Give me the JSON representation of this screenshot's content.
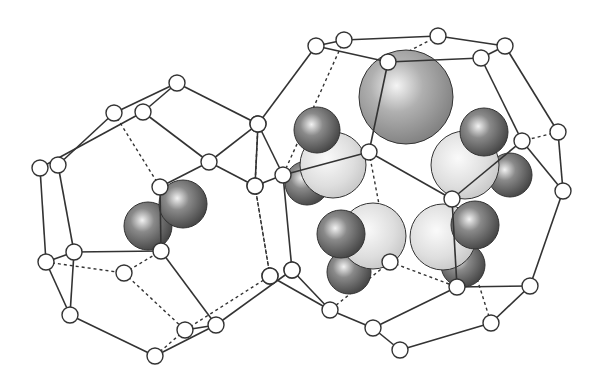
{
  "figure": {
    "left_cage": {
      "label": "small cage with diatomic guest",
      "nodes": [
        [
          177,
          83
        ],
        [
          114,
          113
        ],
        [
          143,
          112
        ],
        [
          40,
          168
        ],
        [
          58,
          165
        ],
        [
          209,
          162
        ],
        [
          160,
          187
        ],
        [
          258,
          124
        ],
        [
          255,
          186
        ],
        [
          46,
          262
        ],
        [
          74,
          252
        ],
        [
          70,
          315
        ],
        [
          124,
          273
        ],
        [
          161,
          251
        ],
        [
          185,
          330
        ],
        [
          216,
          325
        ],
        [
          155,
          356
        ],
        [
          270,
          276
        ],
        [
          292,
          270
        ]
      ],
      "solid_edges": [
        [
          0,
          1
        ],
        [
          0,
          2
        ],
        [
          1,
          4
        ],
        [
          2,
          3
        ],
        [
          0,
          7
        ],
        [
          2,
          5
        ],
        [
          5,
          7
        ],
        [
          5,
          8
        ],
        [
          7,
          8
        ],
        [
          3,
          9
        ],
        [
          4,
          10
        ],
        [
          9,
          10
        ],
        [
          9,
          11
        ],
        [
          10,
          11
        ],
        [
          10,
          13
        ],
        [
          13,
          6
        ],
        [
          11,
          16
        ],
        [
          16,
          15
        ],
        [
          15,
          14
        ],
        [
          13,
          15
        ],
        [
          15,
          18
        ],
        [
          6,
          5
        ]
      ],
      "dashed_edges": [
        [
          1,
          6
        ],
        [
          9,
          12
        ],
        [
          12,
          13
        ],
        [
          12,
          14
        ],
        [
          14,
          16
        ],
        [
          14,
          17
        ],
        [
          17,
          8
        ],
        [
          6,
          255
        ]
      ],
      "guest_spheres": [
        {
          "cx": 148,
          "cy": 226,
          "r": 24,
          "tone": "dark"
        },
        {
          "cx": 183,
          "cy": 204,
          "r": 24,
          "tone": "dark"
        }
      ]
    },
    "right_cage": {
      "label": "large cage with multiple guest molecules",
      "nodes": [
        [
          316,
          46
        ],
        [
          344,
          40
        ],
        [
          388,
          62
        ],
        [
          438,
          36
        ],
        [
          505,
          46
        ],
        [
          481,
          58
        ],
        [
          258,
          124
        ],
        [
          283,
          175
        ],
        [
          255,
          186
        ],
        [
          369,
          152
        ],
        [
          558,
          132
        ],
        [
          522,
          141
        ],
        [
          563,
          191
        ],
        [
          452,
          199
        ],
        [
          457,
          287
        ],
        [
          530,
          286
        ],
        [
          491,
          323
        ],
        [
          400,
          350
        ],
        [
          373,
          328
        ],
        [
          330,
          310
        ],
        [
          292,
          270
        ],
        [
          270,
          276
        ],
        [
          390,
          262
        ]
      ],
      "solid_edges": [
        [
          0,
          1
        ],
        [
          1,
          3
        ],
        [
          3,
          4
        ],
        [
          4,
          5
        ],
        [
          5,
          2
        ],
        [
          0,
          2
        ],
        [
          0,
          6
        ],
        [
          6,
          7
        ],
        [
          7,
          8
        ],
        [
          4,
          10
        ],
        [
          10,
          12
        ],
        [
          5,
          11
        ],
        [
          11,
          13
        ],
        [
          12,
          15
        ],
        [
          15,
          14
        ],
        [
          15,
          16
        ],
        [
          16,
          17
        ],
        [
          17,
          18
        ],
        [
          18,
          19
        ],
        [
          19,
          20
        ],
        [
          20,
          7
        ],
        [
          21,
          19
        ],
        [
          14,
          18
        ],
        [
          2,
          9
        ],
        [
          9,
          7
        ],
        [
          9,
          13
        ],
        [
          13,
          14
        ],
        [
          11,
          12
        ]
      ],
      "dashed_edges": [
        [
          1,
          7
        ],
        [
          3,
          2
        ],
        [
          6,
          8
        ],
        [
          8,
          21
        ],
        [
          10,
          11
        ],
        [
          13,
          16
        ],
        [
          22,
          14
        ],
        [
          22,
          19
        ],
        [
          9,
          22
        ]
      ],
      "guest_spheres": [
        {
          "cx": 406,
          "cy": 97,
          "r": 47,
          "tone": "mid"
        },
        {
          "cx": 307,
          "cy": 183,
          "r": 22,
          "tone": "dark"
        },
        {
          "cx": 333,
          "cy": 165,
          "r": 33,
          "tone": "light"
        },
        {
          "cx": 317,
          "cy": 130,
          "r": 23,
          "tone": "dark"
        },
        {
          "cx": 510,
          "cy": 175,
          "r": 22,
          "tone": "dark"
        },
        {
          "cx": 465,
          "cy": 165,
          "r": 34,
          "tone": "light"
        },
        {
          "cx": 484,
          "cy": 132,
          "r": 24,
          "tone": "dark"
        },
        {
          "cx": 349,
          "cy": 272,
          "r": 22,
          "tone": "dark"
        },
        {
          "cx": 373,
          "cy": 236,
          "r": 33,
          "tone": "light"
        },
        {
          "cx": 341,
          "cy": 234,
          "r": 24,
          "tone": "dark"
        },
        {
          "cx": 463,
          "cy": 265,
          "r": 22,
          "tone": "dark"
        },
        {
          "cx": 443,
          "cy": 237,
          "r": 33,
          "tone": "light"
        },
        {
          "cx": 475,
          "cy": 225,
          "r": 24,
          "tone": "dark"
        }
      ]
    },
    "node_radius": 8,
    "colors": {
      "line": "#333333",
      "node_fill": "#ffffff",
      "dark": "#5a5a5a",
      "mid": "#9a9a9a",
      "light": "#dcdcdc"
    }
  },
  "caption": {
    "text": "",
    "note": "caption text cut off at bottom edge"
  }
}
